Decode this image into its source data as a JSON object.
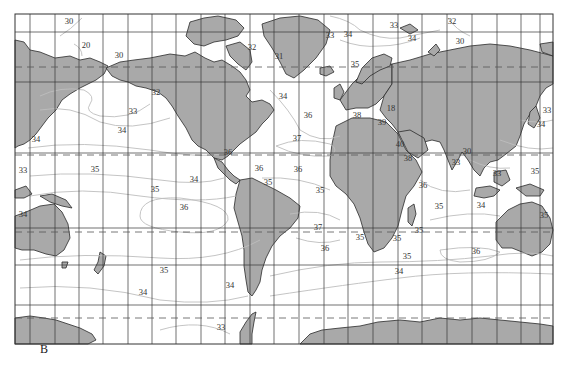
{
  "figure": {
    "panel_label": "B",
    "map_type": "World ocean surface salinity isohalines (Mercator projection)",
    "colors": {
      "land": "#a9a9a9",
      "ocean": "#ffffff",
      "grid": "#333333",
      "isoline": "#b8b8b8",
      "coastline": "#2a2a2a"
    },
    "reference_lines": [
      "Arctic Circle",
      "Tropic of Cancer",
      "Tropic of Capricorn",
      "Antarctic Circle"
    ]
  },
  "labels": [
    {
      "text": "30",
      "x": 69,
      "y": 24
    },
    {
      "text": "20",
      "x": 86,
      "y": 48
    },
    {
      "text": "30",
      "x": 119,
      "y": 58
    },
    {
      "text": "32",
      "x": 156,
      "y": 95
    },
    {
      "text": "33",
      "x": 133,
      "y": 114
    },
    {
      "text": "34",
      "x": 122,
      "y": 133
    },
    {
      "text": "34",
      "x": 36,
      "y": 142
    },
    {
      "text": "33",
      "x": 23,
      "y": 173
    },
    {
      "text": "35",
      "x": 95,
      "y": 172
    },
    {
      "text": "35",
      "x": 155,
      "y": 192
    },
    {
      "text": "36",
      "x": 184,
      "y": 210
    },
    {
      "text": "34",
      "x": 23,
      "y": 217
    },
    {
      "text": "34",
      "x": 194,
      "y": 182
    },
    {
      "text": "32",
      "x": 252,
      "y": 50
    },
    {
      "text": "31",
      "x": 279,
      "y": 59
    },
    {
      "text": "33",
      "x": 330,
      "y": 38
    },
    {
      "text": "34",
      "x": 348,
      "y": 37
    },
    {
      "text": "35",
      "x": 355,
      "y": 67
    },
    {
      "text": "33",
      "x": 394,
      "y": 28
    },
    {
      "text": "32",
      "x": 452,
      "y": 24
    },
    {
      "text": "34",
      "x": 412,
      "y": 41
    },
    {
      "text": "30",
      "x": 460,
      "y": 44
    },
    {
      "text": "34",
      "x": 283,
      "y": 99
    },
    {
      "text": "36",
      "x": 308,
      "y": 118
    },
    {
      "text": "37",
      "x": 297,
      "y": 141
    },
    {
      "text": "36",
      "x": 228,
      "y": 155
    },
    {
      "text": "36",
      "x": 259,
      "y": 171
    },
    {
      "text": "35",
      "x": 268,
      "y": 185
    },
    {
      "text": "36",
      "x": 298,
      "y": 172
    },
    {
      "text": "35",
      "x": 320,
      "y": 193
    },
    {
      "text": "37",
      "x": 318,
      "y": 230
    },
    {
      "text": "36",
      "x": 325,
      "y": 251
    },
    {
      "text": "35",
      "x": 360,
      "y": 240
    },
    {
      "text": "35",
      "x": 397,
      "y": 241
    },
    {
      "text": "35",
      "x": 419,
      "y": 233
    },
    {
      "text": "35",
      "x": 407,
      "y": 259
    },
    {
      "text": "34",
      "x": 399,
      "y": 274
    },
    {
      "text": "36",
      "x": 476,
      "y": 254
    },
    {
      "text": "35",
      "x": 164,
      "y": 273
    },
    {
      "text": "34",
      "x": 143,
      "y": 295
    },
    {
      "text": "34",
      "x": 230,
      "y": 288
    },
    {
      "text": "33",
      "x": 221,
      "y": 330
    },
    {
      "text": "38",
      "x": 357,
      "y": 118
    },
    {
      "text": "18",
      "x": 391,
      "y": 111
    },
    {
      "text": "39",
      "x": 382,
      "y": 125
    },
    {
      "text": "40",
      "x": 400,
      "y": 147
    },
    {
      "text": "38",
      "x": 408,
      "y": 161
    },
    {
      "text": "36",
      "x": 423,
      "y": 188
    },
    {
      "text": "35",
      "x": 439,
      "y": 209
    },
    {
      "text": "34",
      "x": 481,
      "y": 208
    },
    {
      "text": "30",
      "x": 467,
      "y": 154
    },
    {
      "text": "33",
      "x": 456,
      "y": 165
    },
    {
      "text": "33",
      "x": 497,
      "y": 176
    },
    {
      "text": "35",
      "x": 535,
      "y": 174
    },
    {
      "text": "33",
      "x": 547,
      "y": 113
    },
    {
      "text": "34",
      "x": 541,
      "y": 127
    },
    {
      "text": "35",
      "x": 544,
      "y": 218
    }
  ]
}
